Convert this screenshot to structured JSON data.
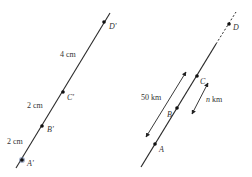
{
  "left_figure": {
    "line": {
      "x1": 16,
      "y1": 168,
      "x2": 110,
      "y2": 13
    },
    "points": [
      {
        "label": "A'",
        "x": 22,
        "y": 160,
        "lx": 27,
        "ly": 166
      },
      {
        "label": "B'",
        "x": 42,
        "y": 126,
        "lx": 47,
        "ly": 132
      },
      {
        "label": "C'",
        "x": 63,
        "y": 92,
        "lx": 67,
        "ly": 100
      },
      {
        "label": "D'",
        "x": 104,
        "y": 22,
        "lx": 109,
        "ly": 29
      }
    ],
    "segments": [
      {
        "label": "2 cm",
        "x": 7,
        "y": 144
      },
      {
        "label": "2 cm",
        "x": 27,
        "y": 108
      },
      {
        "label": "4 cm",
        "x": 60,
        "y": 57
      }
    ]
  },
  "right_figure": {
    "solid_line": {
      "x1": 141,
      "y1": 167,
      "x2": 216,
      "y2": 44
    },
    "dashed_line": {
      "x1": 216,
      "y1": 44,
      "x2": 236,
      "y2": 12
    },
    "points": [
      {
        "label": "A",
        "x": 155,
        "y": 144,
        "lx": 159,
        "ly": 152
      },
      {
        "label": "B",
        "x": 177,
        "y": 108,
        "lx": 167,
        "ly": 117
      },
      {
        "label": "C",
        "x": 197,
        "y": 76,
        "lx": 200,
        "ly": 84
      },
      {
        "label": "D",
        "x": 229,
        "y": 24,
        "lx": 233,
        "ly": 30
      }
    ],
    "dimensions": [
      {
        "label": "50 km",
        "italic": false,
        "x1": 146,
        "y1": 137,
        "x2": 186,
        "y2": 72,
        "tx": 141,
        "ty": 100
      },
      {
        "label": "n km",
        "italic": true,
        "x1": 192,
        "y1": 114,
        "x2": 208,
        "y2": 83,
        "tx": 206,
        "ty": 102
      }
    ]
  },
  "colors": {
    "line": "#2a2a2a",
    "point": "#111111",
    "text": "#333333",
    "highlight": "#6b7fa8"
  }
}
